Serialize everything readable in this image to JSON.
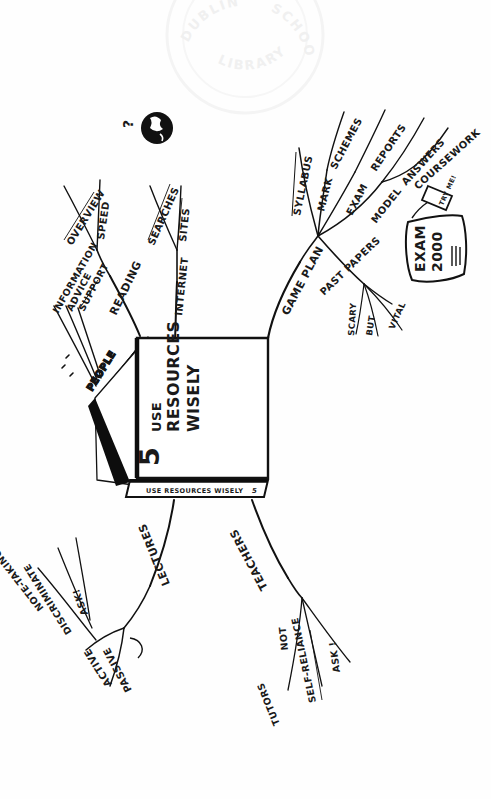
{
  "page": {
    "background_color": "#ffffff",
    "ink_color": "#111111",
    "width": 491,
    "height": 799,
    "orientation_note": "Whole drawing is rotated 90 degrees; text reads bottom-to-top."
  },
  "watermark": {
    "name": "library-stamp",
    "line_top_left": "DUBLIN",
    "line_top_right": "SCHOOL",
    "line_bottom": "LIBRARY",
    "color": "#f2f2f2"
  },
  "center": {
    "name": "open-book",
    "number": "5",
    "title_line_1": "USE",
    "title_line_2": "RESOURCES",
    "title_line_3": "WISELY",
    "spine_text": "USE RESOURCES WISELY",
    "spine_number": "5"
  },
  "icons": {
    "globe": "globe-icon",
    "question_mark": "?",
    "exam_paper": "exam-paper-icon",
    "try_me_tag": "tag-icon"
  },
  "props": {
    "exam_paper_line_1": "EXAM",
    "exam_paper_line_2": "2000",
    "tag_label": "TRY ME!"
  },
  "branches": [
    {
      "id": "game-plan",
      "label": "GAME PLAN",
      "children": [
        {
          "id": "syllabus",
          "label": "SYLLABUS",
          "children": []
        },
        {
          "id": "mark-schemes",
          "label": "MARK",
          "label2": "SCHEMES",
          "children": []
        },
        {
          "id": "exam-reports",
          "label": "EXAM",
          "label2": "REPORTS",
          "children": []
        },
        {
          "id": "model-answers",
          "label": "MODEL",
          "label2": "ANSWERS",
          "children": []
        },
        {
          "id": "coursework",
          "label": "COURSEWORK",
          "children": []
        },
        {
          "id": "past-papers",
          "label": "PAST PAPERS",
          "children": [
            {
              "id": "scary",
              "label": "SCARY"
            },
            {
              "id": "but",
              "label": "BUT"
            },
            {
              "id": "vital",
              "label": "VITAL"
            }
          ]
        }
      ]
    },
    {
      "id": "reading",
      "label": "READING",
      "children": [
        {
          "id": "overview",
          "label": "OVERVIEW"
        },
        {
          "id": "speed",
          "label": "SPEED"
        }
      ]
    },
    {
      "id": "internet",
      "label": "INTERNET",
      "children": [
        {
          "id": "searches",
          "label": "SEARCHES"
        },
        {
          "id": "sites",
          "label": "SITES"
        }
      ]
    },
    {
      "id": "people",
      "label": "PEOPLE",
      "children": [
        {
          "id": "information",
          "label": "INFORMATION"
        },
        {
          "id": "advice",
          "label": "ADVICE"
        },
        {
          "id": "support",
          "label": "SUPPORT"
        }
      ]
    },
    {
      "id": "lectures",
      "label": "LECTURES",
      "children": [
        {
          "id": "active",
          "label": "ACTIVE",
          "children": [
            {
              "id": "note-taking",
              "label": "NOTE-TAKING"
            },
            {
              "id": "discriminate",
              "label": "DISCRIMINATE"
            },
            {
              "id": "ask",
              "label": "ASK!"
            }
          ]
        },
        {
          "id": "passive",
          "label": "PASSIVE",
          "children": []
        }
      ]
    },
    {
      "id": "teachers",
      "label": "TEACHERS",
      "children": [
        {
          "id": "not-tutors-a",
          "label": "NOT"
        },
        {
          "id": "not-tutors-b",
          "label": "TUTORS"
        },
        {
          "id": "self-reliance",
          "label": "SELF-RELIANCE"
        },
        {
          "id": "ask-teachers",
          "label": "ASK !"
        }
      ]
    }
  ]
}
